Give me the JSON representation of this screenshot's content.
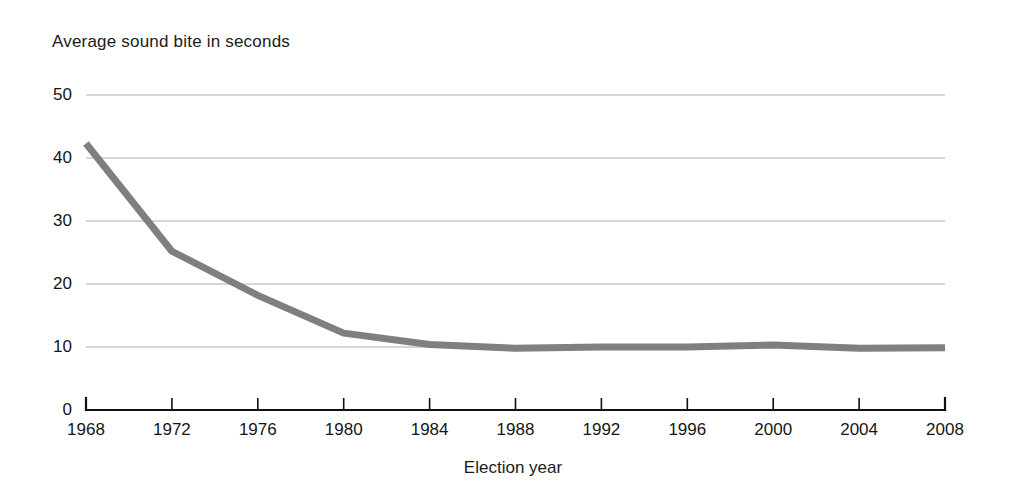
{
  "chart_data": {
    "type": "line",
    "title": "Average sound bite in seconds",
    "xlabel": "Election year",
    "ylabel": "",
    "categories": [
      "1968",
      "1972",
      "1976",
      "1980",
      "1984",
      "1988",
      "1992",
      "1996",
      "2000",
      "2004",
      "2008"
    ],
    "x": [
      1968,
      1972,
      1976,
      1980,
      1984,
      1988,
      1992,
      1996,
      2000,
      2004,
      2008
    ],
    "values": [
      42.3,
      25.2,
      18.2,
      12.2,
      10.4,
      9.8,
      10.0,
      10.0,
      10.3,
      9.8,
      9.9
    ],
    "series": [
      {
        "name": "Average sound bite",
        "values": [
          42.3,
          25.2,
          18.2,
          12.2,
          10.4,
          9.8,
          10.0,
          10.0,
          10.3,
          9.8,
          9.9
        ]
      }
    ],
    "xlim": [
      1968,
      2008
    ],
    "ylim": [
      0,
      50
    ],
    "ytick_labels": [
      "0",
      "10",
      "20",
      "30",
      "40",
      "50"
    ],
    "ytick_values": [
      0,
      10,
      20,
      30,
      40,
      50
    ],
    "xtick_labels": [
      "1968",
      "1972",
      "1976",
      "1980",
      "1984",
      "1988",
      "1992",
      "1996",
      "2000",
      "2004",
      "2008"
    ],
    "grid": "horizontal",
    "legend": "none",
    "line_color": "#7f7f7f",
    "grid_color": "#aeaeae",
    "axis_color": "#111111",
    "background_color": "#ffffff"
  }
}
